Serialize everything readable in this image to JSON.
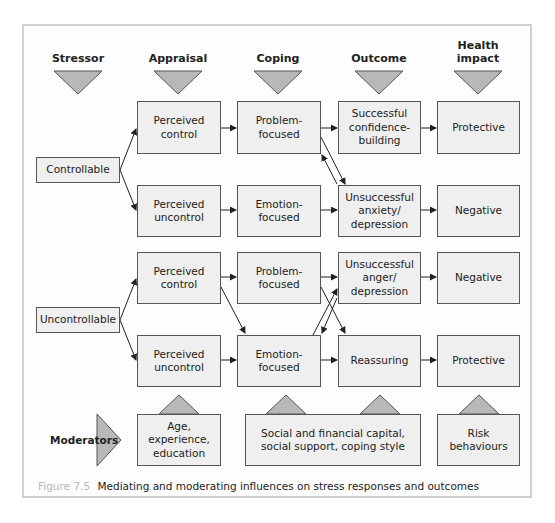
{
  "figure": {
    "caption_label": "Figure 7.5",
    "caption_text": "Mediating and moderating influences on stress responses and outcomes"
  },
  "headers": [
    {
      "label": "Stressor"
    },
    {
      "label": "Appraisal"
    },
    {
      "label": "Coping"
    },
    {
      "label": "Outcome"
    },
    {
      "label": "Health\nimpact"
    }
  ],
  "stressors": {
    "controllable": "Controllable",
    "uncontrollable": "Uncontrollable"
  },
  "rows": [
    {
      "appraisal": "Perceived\ncontrol",
      "coping": "Problem-\nfocused",
      "outcome": "Successful\nconfidence-\nbuilding",
      "health": "Protective"
    },
    {
      "appraisal": "Perceived\nuncontrol",
      "coping": "Emotion-\nfocused",
      "outcome": "Unsuccessful\nanxiety/\ndepression",
      "health": "Negative"
    },
    {
      "appraisal": "Perceived\ncontrol",
      "coping": "Problem-\nfocused",
      "outcome": "Unsuccessful\nanger/\ndepression",
      "health": "Negative"
    },
    {
      "appraisal": "Perceived\nuncontrol",
      "coping": "Emotion-\nfocused",
      "outcome": "Reassuring",
      "health": "Protective"
    }
  ],
  "moderators": {
    "label": "Moderators",
    "items": [
      {
        "text": "Age, experience,\neducation"
      },
      {
        "text": "Social and financial capital,\nsocial support, coping style"
      },
      {
        "text": "Risk\nbehaviours"
      }
    ]
  },
  "colors": {
    "box_fill": "#efefef",
    "box_border": "#555555",
    "triangle_fill": "#b8b8b8",
    "frame_border": "#cfcfcf",
    "caption_label": "#b9b9b9"
  }
}
